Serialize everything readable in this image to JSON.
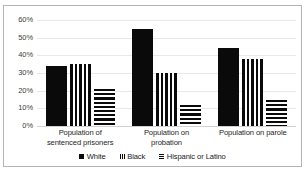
{
  "chart_data": {
    "type": "bar",
    "title": "",
    "subtitle": "",
    "xlabel": "",
    "ylabel": "",
    "ylim": [
      0,
      60
    ],
    "ytick_labels": [
      "60%",
      "50%",
      "40%",
      "30%",
      "20%",
      "10%",
      "0%"
    ],
    "ytick_values": [
      60,
      50,
      40,
      30,
      20,
      10,
      0
    ],
    "grid": true,
    "legend_position": "bottom",
    "categories": [
      "Population of sentenced prisoners",
      "Population on probation",
      "Population on parole"
    ],
    "category_lines": [
      [
        "Population of",
        "sentenced prisoners"
      ],
      [
        "Population on",
        "probation"
      ],
      [
        "Population on parole"
      ]
    ],
    "series": [
      {
        "name": "White",
        "pattern": "solid",
        "values": [
          34,
          55,
          44
        ]
      },
      {
        "name": "Black",
        "pattern": "vertical-stripes",
        "values": [
          35,
          30,
          38
        ]
      },
      {
        "name": "Hispanic or Latino",
        "pattern": "horizontal-stripes",
        "values": [
          21,
          12,
          15
        ]
      }
    ]
  },
  "legend": {
    "items": [
      {
        "label": "White",
        "pattern": "solid"
      },
      {
        "label": "Black",
        "pattern": "vertical-stripes"
      },
      {
        "label": "Hispanic or Latino",
        "pattern": "horizontal-stripes"
      }
    ]
  },
  "colors": {
    "bar_foreground": "#0a0a0a",
    "bar_background": "#ffffff",
    "gridline": "#e8e8e8",
    "border": "#b4b4b4",
    "axis_text": "#404040",
    "plot_background": "#ffffff"
  }
}
